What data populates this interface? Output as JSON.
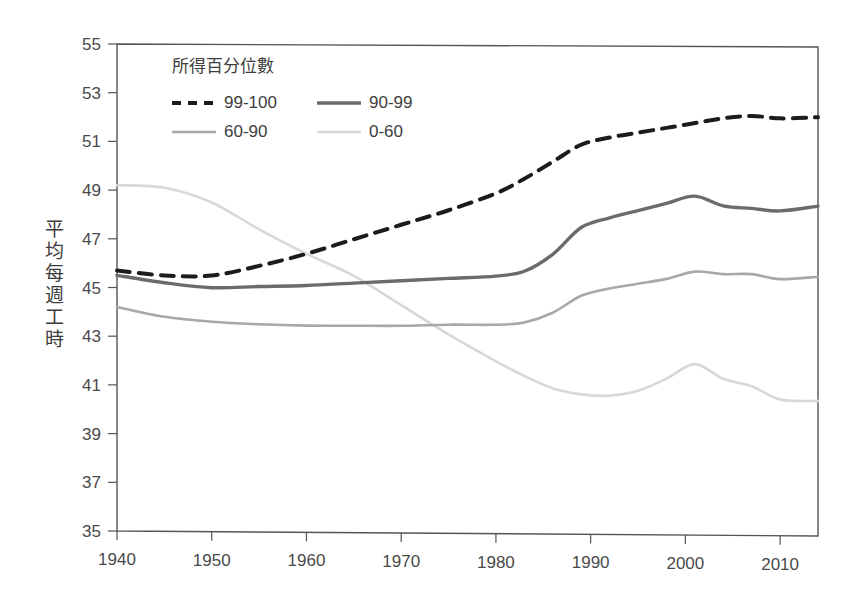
{
  "chart_data": {
    "type": "line",
    "title": "",
    "xlabel": "",
    "ylabel": "平均每週工時",
    "legend_title": "所得百分位數",
    "legend_position": "top-left-inside",
    "grid": false,
    "xlim": [
      1940,
      2014
    ],
    "ylim": [
      35,
      55
    ],
    "xticks": [
      1940,
      1950,
      1960,
      1970,
      1980,
      1990,
      2000,
      2010
    ],
    "xtick_labels": [
      "1940",
      "1950",
      "1960",
      "1970",
      "1980",
      "1990",
      "2000",
      "2010"
    ],
    "yticks": [
      35,
      37,
      39,
      41,
      43,
      45,
      47,
      49,
      51,
      53,
      55
    ],
    "ytick_labels": [
      "35",
      "37",
      "39",
      "41",
      "43",
      "45",
      "47",
      "49",
      "51",
      "53",
      "55"
    ],
    "x": [
      1940,
      1945,
      1950,
      1955,
      1960,
      1965,
      1970,
      1975,
      1980,
      1983,
      1986,
      1989,
      1992,
      1995,
      1998,
      2001,
      2004,
      2007,
      2010,
      2014
    ],
    "series": [
      {
        "name": "99-100",
        "style": "dashed",
        "color": "#1c1c1c",
        "width": 4.0,
        "values": [
          45.7,
          45.5,
          45.5,
          45.9,
          46.4,
          47.0,
          47.6,
          48.2,
          48.9,
          49.5,
          50.2,
          50.9,
          51.2,
          51.4,
          51.6,
          51.8,
          52.0,
          52.1,
          52.0,
          52.05
        ]
      },
      {
        "name": "90-99",
        "style": "solid",
        "color": "#6b6b6b",
        "width": 3.4,
        "values": [
          45.5,
          45.2,
          45.0,
          45.05,
          45.1,
          45.2,
          45.3,
          45.4,
          45.5,
          45.7,
          46.4,
          47.5,
          47.9,
          48.2,
          48.5,
          48.8,
          48.4,
          48.3,
          48.2,
          48.4
        ]
      },
      {
        "name": "60-90",
        "style": "solid",
        "color": "#a8a8a8",
        "width": 2.6,
        "values": [
          44.2,
          43.8,
          43.6,
          43.5,
          43.45,
          43.45,
          43.45,
          43.5,
          43.5,
          43.6,
          44.0,
          44.7,
          45.0,
          45.2,
          45.4,
          45.7,
          45.6,
          45.6,
          45.4,
          45.5
        ]
      },
      {
        "name": "0-60",
        "style": "solid",
        "color": "#d8d8d8",
        "width": 2.6,
        "values": [
          49.2,
          49.1,
          48.5,
          47.4,
          46.4,
          45.5,
          44.3,
          43.1,
          42.0,
          41.4,
          40.9,
          40.65,
          40.6,
          40.8,
          41.3,
          41.9,
          41.3,
          41.0,
          40.45,
          40.4
        ]
      }
    ],
    "legend_entries": [
      {
        "label": "99-100",
        "style": "dashed",
        "color": "#1c1c1c",
        "width": 4.0
      },
      {
        "label": "90-99",
        "style": "solid",
        "color": "#6b6b6b",
        "width": 3.6
      },
      {
        "label": "60-90",
        "style": "solid",
        "color": "#a8a8a8",
        "width": 2.4
      },
      {
        "label": "0-60",
        "style": "solid",
        "color": "#d8d8d8",
        "width": 2.4
      }
    ],
    "ylabel_chars": [
      "平",
      "均",
      "每",
      "週",
      "工",
      "時"
    ]
  }
}
